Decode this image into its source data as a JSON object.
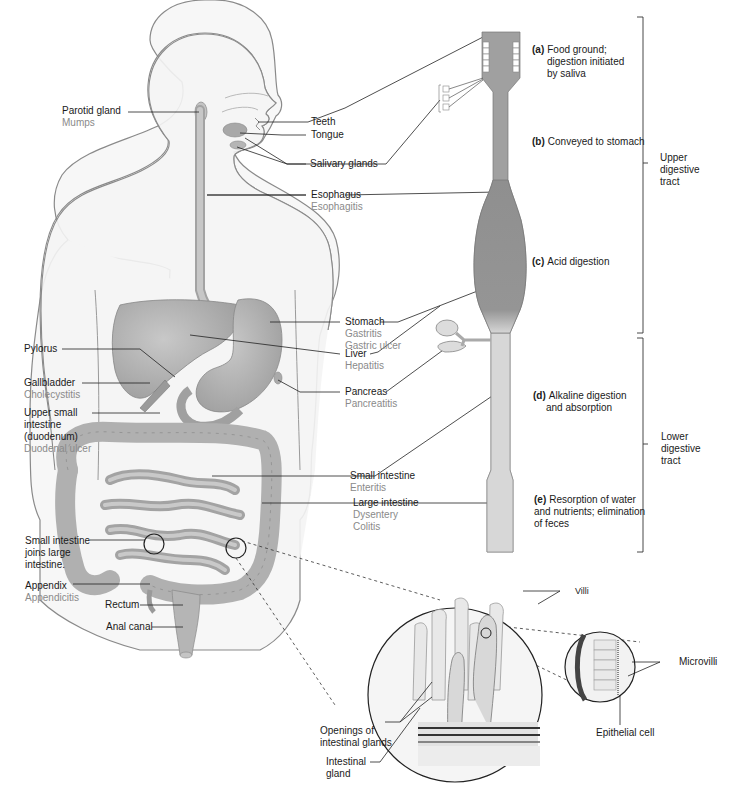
{
  "figure": {
    "body_labels": {
      "parotid_gland": {
        "name": "Parotid gland",
        "disease": "Mumps"
      },
      "teeth": {
        "name": "Teeth"
      },
      "tongue": {
        "name": "Tongue"
      },
      "salivary_glands": {
        "name": "Salivary glands"
      },
      "esophagus": {
        "name": "Esophagus",
        "disease": "Esophagitis"
      },
      "stomach": {
        "name": "Stomach",
        "diseases": [
          "Gastritis",
          "Gastric ulcer"
        ]
      },
      "liver": {
        "name": "Liver",
        "disease": "Hepatitis"
      },
      "pancreas": {
        "name": "Pancreas",
        "disease": "Pancreatitis"
      },
      "pylorus": {
        "name": "Pylorus"
      },
      "gallbladder": {
        "name": "Gallbladder",
        "disease": "Cholecystitis"
      },
      "duodenum": {
        "name_lines": [
          "Upper small",
          "intestine",
          "(duodenum)"
        ],
        "disease": "Duodenal ulcer"
      },
      "small_intestine": {
        "name": "Small intestine",
        "disease": "Enteritis"
      },
      "large_intestine": {
        "name": "Large intestine",
        "diseases": [
          "Dysentery",
          "Colitis"
        ]
      },
      "junction": {
        "name_lines": [
          "Small intestine",
          "joins large",
          "intestine."
        ]
      },
      "appendix": {
        "name": "Appendix",
        "disease": "Appendicitis"
      },
      "rectum": {
        "name": "Rectum"
      },
      "anal_canal": {
        "name": "Anal canal"
      }
    },
    "tract_steps": [
      {
        "letter": "(a)",
        "lines": [
          "Food ground;",
          "digestion initiated",
          "by saliva"
        ]
      },
      {
        "letter": "(b)",
        "lines": [
          "Conveyed to stomach"
        ]
      },
      {
        "letter": "(c)",
        "lines": [
          "Acid digestion"
        ]
      },
      {
        "letter": "(d)",
        "lines": [
          "Alkaline digestion",
          "and absorption"
        ]
      },
      {
        "letter": "(e)",
        "lines": [
          "Resorption of water",
          "and nutrients; elimination",
          "of feces"
        ]
      }
    ],
    "brackets": {
      "upper": [
        "Upper",
        "digestive",
        "tract"
      ],
      "lower": [
        "Lower",
        "digestive",
        "tract"
      ]
    },
    "detail_labels": {
      "villi": "Villi",
      "microvilli": "Microvilli",
      "epithelial_cell": "Epithelial cell",
      "openings": [
        "Openings of",
        "intestinal glands"
      ],
      "intestinal_gland": [
        "Intestinal",
        "gland"
      ]
    },
    "colors": {
      "outline": "#7a7a7a",
      "organ_fill": "#b9b9b9",
      "tube_fill": "#9c9c9c",
      "text": "#1a1a1a",
      "disease_text": "#8a8a8a"
    }
  }
}
